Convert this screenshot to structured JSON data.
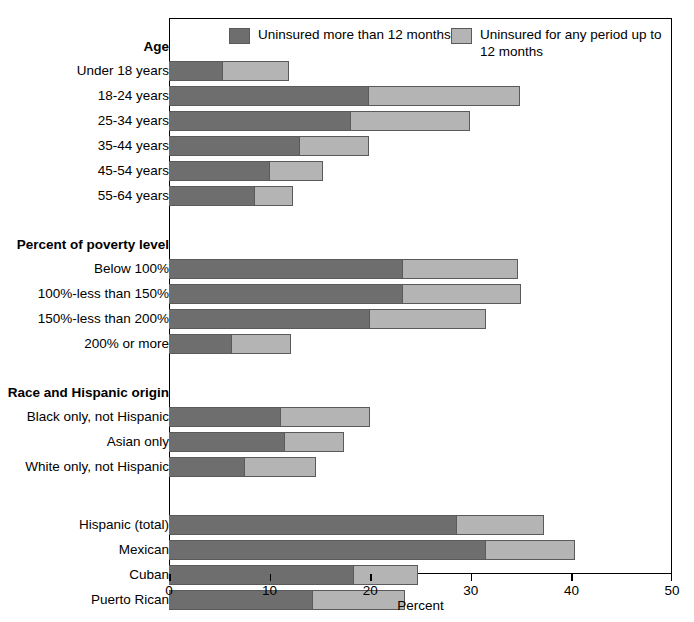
{
  "chart_data": {
    "type": "bar",
    "orientation": "horizontal",
    "stacked": true,
    "title": "",
    "xlabel": "Percent",
    "ylabel": "",
    "xlim": [
      0,
      50
    ],
    "xticks": [
      0,
      10,
      20,
      30,
      40,
      50
    ],
    "xtick_labels": [
      "0",
      "10",
      "20",
      "30",
      "40",
      "50"
    ],
    "grid": false,
    "legend_position": "top-inside",
    "series": [
      {
        "name": "Uninsured more than 12 months",
        "color": "#6e6e6e"
      },
      {
        "name": "Uninsured for any period up to 12 months",
        "color": "#b4b4b4"
      }
    ],
    "groups": [
      {
        "group_label": "Age",
        "rows": [
          {
            "label": "Under 18 years",
            "values": [
              5.4,
              6.5
            ],
            "total": 11.9
          },
          {
            "label": "18-24 years",
            "values": [
              19.9,
              15.0
            ],
            "total": 34.9
          },
          {
            "label": "25-34 years",
            "values": [
              18.1,
              11.8
            ],
            "total": 29.9
          },
          {
            "label": "35-44 years",
            "values": [
              13.0,
              6.9
            ],
            "total": 19.9
          },
          {
            "label": "45-54 years",
            "values": [
              10.0,
              5.3
            ],
            "total": 15.3
          },
          {
            "label": "55-64 years",
            "values": [
              8.5,
              3.8
            ],
            "total": 12.3
          }
        ]
      },
      {
        "group_label": "Percent of poverty level",
        "rows": [
          {
            "label": "Below 100%",
            "values": [
              23.3,
              11.4
            ],
            "total": 34.7
          },
          {
            "label": "100%-less than 150%",
            "values": [
              23.3,
              11.7
            ],
            "total": 35.0
          },
          {
            "label": "150%-less than 200%",
            "values": [
              20.0,
              11.5
            ],
            "total": 31.5
          },
          {
            "label": "200% or more",
            "values": [
              6.3,
              5.8
            ],
            "total": 12.1
          }
        ]
      },
      {
        "group_label": "Race and Hispanic origin",
        "rows": [
          {
            "label": "Black only, not Hispanic",
            "values": [
              11.1,
              8.9
            ],
            "total": 20.0
          },
          {
            "label": "Asian only",
            "values": [
              11.5,
              5.9
            ],
            "total": 17.4
          },
          {
            "label": "White only, not Hispanic",
            "values": [
              7.6,
              7.0
            ],
            "total": 14.6
          }
        ]
      },
      {
        "group_label": "",
        "rows": [
          {
            "label": "Hispanic (total)",
            "values": [
              28.6,
              8.7
            ],
            "total": 37.3
          },
          {
            "label": "Mexican",
            "values": [
              31.5,
              8.9
            ],
            "total": 40.4
          },
          {
            "label": "Cuban",
            "values": [
              18.4,
              6.4
            ],
            "total": 24.8
          },
          {
            "label": "Puerto Rican",
            "values": [
              14.3,
              9.2
            ],
            "total": 23.5
          }
        ]
      }
    ]
  },
  "legend": {
    "entries": [
      {
        "label": "Uninsured more than 12 months",
        "swatch": "dark"
      },
      {
        "label": "Uninsured for any period up to 12 months",
        "swatch": "light"
      }
    ]
  },
  "axis": {
    "x_title": "Percent",
    "ticks": [
      "0",
      "10",
      "20",
      "30",
      "40",
      "50"
    ]
  },
  "colors": {
    "dark": "#6e6e6e",
    "light": "#b4b4b4",
    "outline": "#5a5a5a",
    "frame": "#000000",
    "background": "#ffffff"
  }
}
